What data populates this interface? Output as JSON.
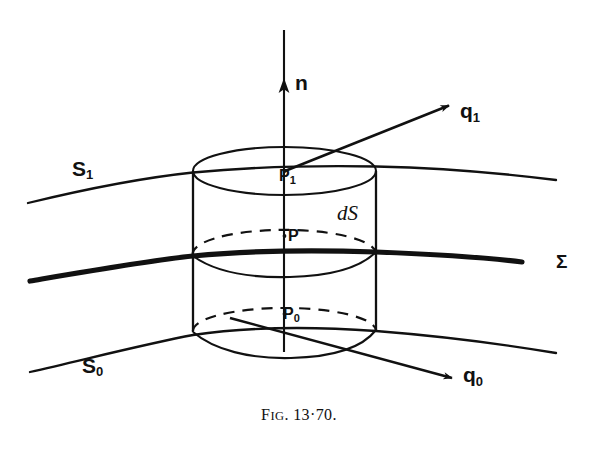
{
  "figure": {
    "caption_prefix": "F",
    "caption_smallcaps": "IG",
    "caption_number": ". 13·70.",
    "caption_full": "Fig. 13·70.",
    "background_color": "#ffffff",
    "ink_color": "#111111"
  },
  "labels": {
    "surface_upper": {
      "base": "S",
      "sub": "1"
    },
    "surface_lower": {
      "base": "S",
      "sub": "0"
    },
    "interface": "Σ",
    "normal_vector": {
      "base": "n",
      "sub": ""
    },
    "flux_upper": {
      "base": "q",
      "sub": "1"
    },
    "flux_lower": {
      "base": "q",
      "sub": "0"
    },
    "point_upper": {
      "base": "P",
      "sub": "1"
    },
    "point_mid": {
      "base": "P",
      "sub": ""
    },
    "point_lower": {
      "base": "P",
      "sub": "0"
    },
    "area_element": "dS"
  },
  "geometry": {
    "cylinder": {
      "left_x": 193,
      "right_x": 376,
      "center_x": 284,
      "radius_x": 91.5,
      "radius_y": 24,
      "top_cap_y": 171,
      "bottom_cap_y": 330,
      "mid_y": 254
    },
    "axis": {
      "x": 284,
      "top_y": 28,
      "bottom_y": 352,
      "arrow_y": 82
    },
    "arrow_q1": {
      "x1": 285,
      "y1": 171,
      "x2": 452,
      "y2": 104
    },
    "arrow_q0": {
      "x1": 284,
      "y1": 333,
      "x2": 455,
      "y2": 379
    }
  },
  "annotations": {
    "description": "Pillbox (right circular cylinder) straddling interface Σ between surfaces S1 and S0, showing outward normal n, flux vectors q1 and q0, points P1, P, P0 and area element dS."
  }
}
